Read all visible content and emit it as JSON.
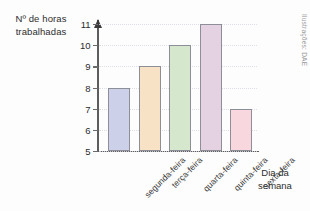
{
  "chart_data": {
    "type": "bar",
    "title": "",
    "ylabel": "Nº de horas trabalhadas",
    "xlabel": "Dia da semana",
    "categories": [
      "segunda-feira",
      "terça-feira",
      "quarta-feira",
      "quinta-feira",
      "sexta-feira"
    ],
    "values": [
      8,
      9,
      10,
      11,
      7
    ],
    "ylim": [
      5,
      11
    ],
    "yticks": [
      11,
      10,
      9,
      8,
      7,
      6,
      5
    ],
    "grid": true,
    "legend": false,
    "bar_colors": [
      "#ccd0e8",
      "#f7e2c6",
      "#d5e8cd",
      "#e4d2e2",
      "#f9d7de"
    ],
    "bar_border_color": "#8e8e99",
    "axis_color": "#5d5d5d",
    "credit": "Ilustrações: DAE"
  }
}
